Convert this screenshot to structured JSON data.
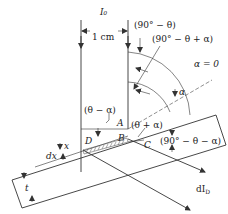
{
  "diagram": {
    "labels": {
      "incident_beam": "I₀",
      "width": "1 cm",
      "angle_top": "(90° − θ)",
      "angle_mid": "(90° − θ + α)",
      "alpha_zero": "α = 0",
      "alpha": "α",
      "theta_minus_alpha": "(θ − α)",
      "theta_plus_alpha": "(θ + α)",
      "angle_bottom": "(90° − θ − α)",
      "point_A": "A",
      "point_B": "B",
      "point_C": "C",
      "point_D": "D",
      "dx": "dx",
      "x": "x",
      "t": "t",
      "diffracted_beam": "dIᴅ"
    },
    "diffracted_beam_label": "dI",
    "diffracted_beam_sub": "D",
    "colors": {
      "line": "#333333",
      "text": "#222222",
      "background": "#ffffff"
    }
  }
}
